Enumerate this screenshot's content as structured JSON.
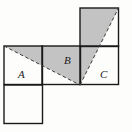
{
  "figure": {
    "canvas": {
      "width": 132,
      "height": 132
    },
    "background_color": "#fdfdfb",
    "stroke_color": "#1a1a1a",
    "shade_color": "#c3c3c3",
    "dash_color": "#3a3a3a",
    "unit": 38.5,
    "labels": {
      "a": "A",
      "b": "B",
      "c": "C"
    },
    "squares": [
      {
        "name": "square-A",
        "x": 4,
        "y": 46,
        "size": 38.5,
        "label": "A"
      },
      {
        "name": "square-below-A",
        "x": 4,
        "y": 85,
        "size": 38.5,
        "label": ""
      },
      {
        "name": "square-B",
        "x": 42,
        "y": 46,
        "size": 38.5,
        "label": "B"
      },
      {
        "name": "square-C",
        "x": 80,
        "y": 46,
        "size": 38.5,
        "label": "C"
      },
      {
        "name": "square-top-right",
        "x": 80,
        "y": 8,
        "size": 38.5,
        "label": ""
      }
    ],
    "shaded_regions": [
      {
        "name": "shaded-triangle-left",
        "points": "4,46 80,46 80,85",
        "fill": "#c3c3c3"
      },
      {
        "name": "shaded-triangle-right",
        "points": "80,85 80,8 118.5,8",
        "fill": "#c3c3c3"
      }
    ],
    "dashed_lines": [
      {
        "name": "dashed-hypotenuse-left",
        "x1": 4,
        "y1": 46,
        "x2": 80,
        "y2": 85
      },
      {
        "name": "dashed-hypotenuse-right",
        "x1": 80,
        "y1": 85,
        "x2": 118.5,
        "y2": 8
      }
    ]
  }
}
